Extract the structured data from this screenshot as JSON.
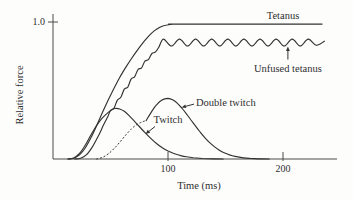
{
  "figure": {
    "background": "#fdfdfc",
    "ink_color": "#333333"
  },
  "chart_data": {
    "type": "line",
    "title": "",
    "xlabel": "Time (ms)",
    "ylabel": "Relative force",
    "xlim": [
      0,
      247
    ],
    "ylim": [
      0,
      1.08
    ],
    "grid": false,
    "legend_position": "inline-annotations",
    "x_ticks": [
      {
        "value": 100,
        "label": "100"
      },
      {
        "value": 200,
        "label": "200"
      }
    ],
    "y_ticks": [
      {
        "value": 1.0,
        "label": "1.0"
      }
    ],
    "series": [
      {
        "name": "Tetanus",
        "style": "solid",
        "points": [
          [
            13,
            0
          ],
          [
            18,
            0.005
          ],
          [
            23,
            0.03
          ],
          [
            28,
            0.08
          ],
          [
            33,
            0.155
          ],
          [
            38,
            0.245
          ],
          [
            43,
            0.34
          ],
          [
            48,
            0.43
          ],
          [
            53,
            0.515
          ],
          [
            58,
            0.595
          ],
          [
            63,
            0.665
          ],
          [
            68,
            0.73
          ],
          [
            73,
            0.79
          ],
          [
            78,
            0.845
          ],
          [
            83,
            0.895
          ],
          [
            88,
            0.935
          ],
          [
            93,
            0.962
          ],
          [
            98,
            0.977
          ],
          [
            104,
            0.983
          ],
          [
            112,
            0.985
          ],
          [
            234,
            0.985
          ]
        ]
      },
      {
        "name": "Unfused tetanus",
        "style": "solid",
        "points": [
          [
            19,
            0
          ],
          [
            24,
            0.005
          ],
          [
            29,
            0.03
          ],
          [
            34,
            0.085
          ],
          [
            39,
            0.16
          ],
          [
            44,
            0.25
          ],
          [
            48,
            0.315
          ],
          [
            50,
            0.355
          ],
          [
            53,
            0.37
          ],
          [
            56,
            0.43
          ],
          [
            59,
            0.45
          ],
          [
            62,
            0.51
          ],
          [
            65,
            0.525
          ],
          [
            68,
            0.585
          ],
          [
            71,
            0.6
          ],
          [
            74,
            0.655
          ],
          [
            77,
            0.665
          ],
          [
            80,
            0.715
          ],
          [
            83,
            0.725
          ],
          [
            86,
            0.77
          ],
          [
            89,
            0.78
          ],
          [
            92,
            0.815
          ],
          [
            96,
            0.875
          ],
          [
            103,
            0.825
          ],
          [
            110,
            0.875
          ],
          [
            117,
            0.825
          ],
          [
            124,
            0.875
          ],
          [
            131,
            0.825
          ],
          [
            138,
            0.875
          ],
          [
            145,
            0.825
          ],
          [
            152,
            0.875
          ],
          [
            159,
            0.825
          ],
          [
            166,
            0.875
          ],
          [
            173,
            0.825
          ],
          [
            180,
            0.875
          ],
          [
            187,
            0.825
          ],
          [
            194,
            0.875
          ],
          [
            201,
            0.825
          ],
          [
            208,
            0.875
          ],
          [
            215,
            0.825
          ],
          [
            222,
            0.875
          ],
          [
            229,
            0.83
          ],
          [
            236,
            0.86
          ]
        ]
      },
      {
        "name": "Twitch",
        "style": "solid",
        "points": [
          [
            13,
            0
          ],
          [
            18,
            0.008
          ],
          [
            23,
            0.04
          ],
          [
            28,
            0.1
          ],
          [
            33,
            0.175
          ],
          [
            38,
            0.245
          ],
          [
            43,
            0.3
          ],
          [
            48,
            0.34
          ],
          [
            52,
            0.363
          ],
          [
            55,
            0.37
          ],
          [
            58,
            0.365
          ],
          [
            62,
            0.348
          ],
          [
            66,
            0.318
          ],
          [
            70,
            0.283
          ],
          [
            75,
            0.237
          ],
          [
            80,
            0.192
          ],
          [
            85,
            0.15
          ],
          [
            90,
            0.113
          ],
          [
            95,
            0.082
          ],
          [
            100,
            0.058
          ],
          [
            105,
            0.04
          ],
          [
            110,
            0.027
          ],
          [
            116,
            0.016
          ],
          [
            122,
            0.009
          ],
          [
            130,
            0.004
          ],
          [
            140,
            0.001
          ],
          [
            148,
            0
          ]
        ]
      },
      {
        "name": "Double twitch",
        "style": "solid",
        "points": [
          [
            81,
            0.28
          ],
          [
            84,
            0.322
          ],
          [
            87,
            0.362
          ],
          [
            90,
            0.395
          ],
          [
            93,
            0.42
          ],
          [
            96,
            0.435
          ],
          [
            100,
            0.442
          ],
          [
            104,
            0.432
          ],
          [
            108,
            0.408
          ],
          [
            112,
            0.372
          ],
          [
            116,
            0.33
          ],
          [
            120,
            0.285
          ],
          [
            124,
            0.24
          ],
          [
            128,
            0.196
          ],
          [
            132,
            0.156
          ],
          [
            136,
            0.121
          ],
          [
            140,
            0.092
          ],
          [
            144,
            0.068
          ],
          [
            148,
            0.049
          ],
          [
            152,
            0.035
          ],
          [
            156,
            0.024
          ],
          [
            161,
            0.015
          ],
          [
            166,
            0.008
          ],
          [
            172,
            0.004
          ],
          [
            180,
            0.001
          ],
          [
            188,
            0
          ]
        ]
      },
      {
        "name": "Second twitch onset (dotted)",
        "style": "dotted",
        "points": [
          [
            38,
            0
          ],
          [
            43,
            0.012
          ],
          [
            48,
            0.037
          ],
          [
            53,
            0.075
          ],
          [
            58,
            0.122
          ],
          [
            63,
            0.172
          ],
          [
            68,
            0.218
          ],
          [
            73,
            0.252
          ],
          [
            78,
            0.272
          ],
          [
            81,
            0.28
          ]
        ]
      }
    ],
    "annotations": [
      {
        "id": "tetanus",
        "text": "Tetanus",
        "t": 200,
        "f": 1.022,
        "anchor": "middle",
        "arrow": null
      },
      {
        "id": "unfused-tetanus",
        "text": "Unfused tetanus",
        "t": 204.3,
        "f": 0.635,
        "anchor": "middle",
        "arrow": {
          "from_t": 204.3,
          "from_f": 0.726,
          "to_t": 204.3,
          "to_f": 0.821
        }
      },
      {
        "id": "double-twitch",
        "text": "Double twitch",
        "t": 124.3,
        "f": 0.387,
        "anchor": "start",
        "arrow": {
          "from_t": 122.6,
          "from_f": 0.401,
          "to_t": 111.7,
          "to_f": 0.376
        }
      },
      {
        "id": "twitch",
        "text": "Twitch",
        "t": 100,
        "f": 0.263,
        "anchor": "middle",
        "arrow": {
          "from_t": 88.7,
          "from_f": 0.237,
          "to_t": 80.4,
          "to_f": 0.182
        }
      }
    ]
  }
}
